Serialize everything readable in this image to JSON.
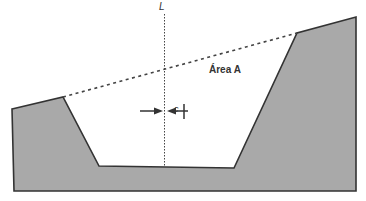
{
  "diagram": {
    "labels": {
      "line": "L",
      "area": "Área A",
      "gap": "c"
    },
    "colors": {
      "fill": "#a9a9a9",
      "stroke": "#333333",
      "background": "#ffffff"
    }
  }
}
